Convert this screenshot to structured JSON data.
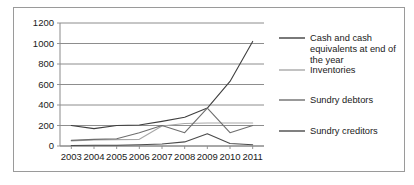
{
  "chart_data": {
    "type": "line",
    "title": "",
    "xlabel": "",
    "ylabel": "",
    "categories": [
      "2003",
      "2004",
      "2005",
      "2006",
      "2007",
      "2008",
      "2009",
      "2010",
      "2011"
    ],
    "x": [
      2003,
      2004,
      2005,
      2006,
      2007,
      2008,
      2009,
      2010,
      2011
    ],
    "ylim": [
      0,
      1200
    ],
    "yticks": [
      0,
      200,
      400,
      600,
      800,
      1000,
      1200
    ],
    "ytick_labels": [
      "0",
      "200",
      "400",
      "600",
      "800",
      "1000",
      "1200"
    ],
    "grid": true,
    "legend_position": "right",
    "series": [
      {
        "name": "Cash and cash equivalents at end of the year",
        "color": "#3f3f3f",
        "values": [
          200,
          170,
          200,
          205,
          240,
          280,
          370,
          630,
          1020
        ]
      },
      {
        "name": "Inventories",
        "color": "#a8a8a8",
        "values": [
          50,
          60,
          62,
          65,
          195,
          220,
          225,
          225,
          225
        ]
      },
      {
        "name": "Sundry debtors",
        "color": "#6e6e6e",
        "values": [
          55,
          65,
          70,
          130,
          200,
          130,
          370,
          130,
          200
        ]
      },
      {
        "name": "Sundry creditors",
        "color": "#4a4a4a",
        "values": [
          5,
          8,
          8,
          12,
          20,
          40,
          120,
          25,
          12
        ]
      }
    ]
  },
  "legend": {
    "entries": [
      {
        "label": "Cash and cash equivalents at end of the year"
      },
      {
        "label": "Inventories"
      },
      {
        "label": "Sundry debtors"
      },
      {
        "label": "Sundry creditors"
      }
    ]
  }
}
